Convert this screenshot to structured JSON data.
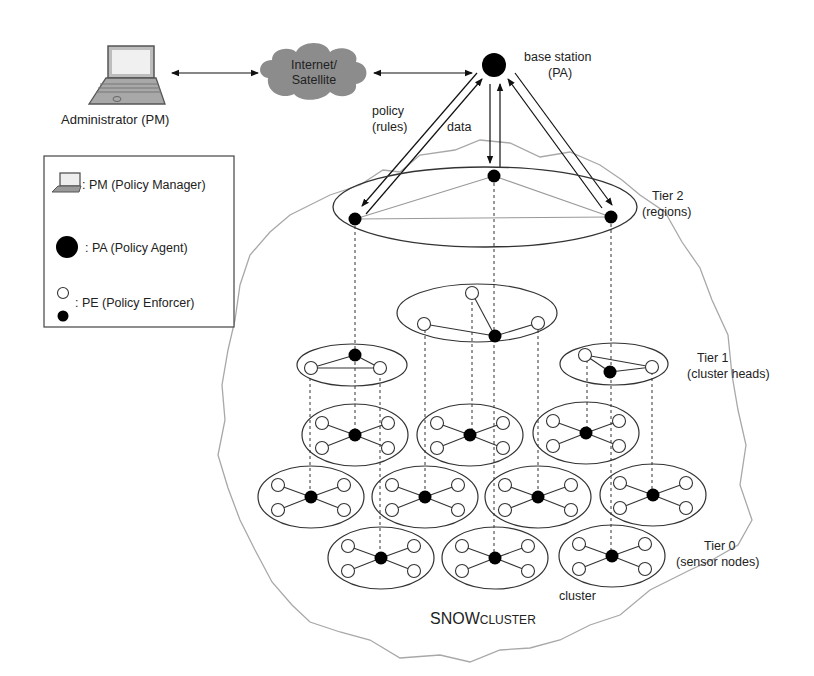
{
  "diagram": {
    "title": "SNOWCLUSTER",
    "title_main": "SNOW",
    "title_small": "CLUSTER",
    "nodes": {
      "administrator": "Administrator (PM)",
      "internet_line1": "Internet/",
      "internet_line2": "Satellite",
      "base_station_line1": "base station",
      "base_station_line2": "(PA)"
    },
    "flows": {
      "policy_line1": "policy",
      "policy_line2": "(rules)",
      "data": "data"
    },
    "tiers": [
      {
        "line1": "Tier 2",
        "line2": "(regions)"
      },
      {
        "line1": "Tier 1",
        "line2": "(cluster heads)"
      },
      {
        "line1": "Tier 0",
        "line2": "(sensor nodes)"
      }
    ],
    "cluster_label": "cluster",
    "legend": [
      {
        "icon": "laptop-icon",
        "text": ": PM (Policy Manager)"
      },
      {
        "icon": "filled-large-circle-icon",
        "text": ": PA (Policy Agent)"
      },
      {
        "icon": "open-and-filled-small-circle-icon",
        "text": ": PE (Policy Enforcer)"
      }
    ],
    "colors": {
      "cloud": "#8c8c8c",
      "boundary": "#a8a8a8",
      "node_fill": "#000000",
      "edge": "#555555"
    }
  }
}
